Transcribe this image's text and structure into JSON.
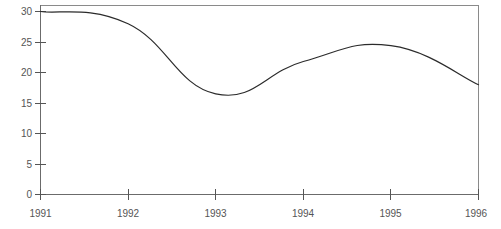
{
  "chart_data": {
    "type": "line",
    "title": "",
    "subtitle": "",
    "xlabel": "",
    "ylabel": "",
    "categories": [
      "1991",
      "1992",
      "1993",
      "1994",
      "1995",
      "1996"
    ],
    "x": [
      1991,
      1992,
      1993,
      1994,
      1995,
      1996
    ],
    "values": [
      30.0,
      28.0,
      16.5,
      21.8,
      24.4,
      18.0
    ],
    "series": [
      {
        "name": "",
        "values": [
          30.0,
          28.0,
          16.5,
          21.8,
          24.4,
          18.0
        ]
      }
    ],
    "xlim": [
      1991,
      1996
    ],
    "ylim": [
      0,
      30
    ],
    "y_ticks": [
      0,
      5,
      10,
      15,
      20,
      25,
      30
    ],
    "y_tick_labels": [
      "0",
      "5",
      "10",
      "15",
      "20",
      "25",
      "30"
    ],
    "x_ticks": [
      1991,
      1992,
      1993,
      1994,
      1995,
      1996
    ],
    "x_tick_labels": [
      "1991",
      "1992",
      "1993",
      "1994",
      "1995",
      "1996"
    ],
    "grid": false,
    "legend": null,
    "legend_position": "none",
    "annotations": [],
    "line_color": "#2b2b2b",
    "axis_color": "#6b6b6b",
    "frame_color": "#8a8a8a",
    "tick_label_color": "#555555",
    "background_color": "#ffffff",
    "smoothing": "spline"
  }
}
